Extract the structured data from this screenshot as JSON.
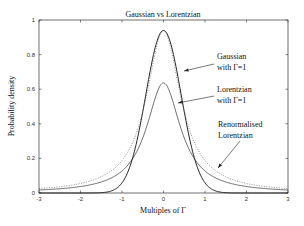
{
  "chart_data": {
    "type": "line",
    "title": "Gaussian vs Lorentzian",
    "xlabel": "Multiples of Γ",
    "ylabel": "Probability density",
    "xlim": [
      -3,
      3
    ],
    "ylim": [
      0,
      1
    ],
    "xticks": [
      "-3",
      "-2",
      "-1",
      "0",
      "1",
      "2",
      "3"
    ],
    "yticks": [
      "0",
      "0.2",
      "0.4",
      "0.6",
      "0.8",
      "1"
    ],
    "grid": false,
    "series": [
      {
        "name": "Gaussian with Γ=1",
        "style": "solid",
        "formula": "FWHM=1 gaussian",
        "peak": 0.94,
        "x": [
          -3,
          -2,
          -1.5,
          -1,
          -0.75,
          -0.5,
          -0.25,
          0,
          0.25,
          0.5,
          0.75,
          1,
          1.5,
          2,
          3
        ],
        "y": [
          0.0,
          0.0,
          0.0,
          0.06,
          0.21,
          0.47,
          0.79,
          0.94,
          0.79,
          0.47,
          0.21,
          0.06,
          0.0,
          0.0,
          0.0
        ]
      },
      {
        "name": "Lorentzian with Γ=1",
        "style": "solid",
        "formula": "FWHM=1 lorentzian",
        "peak": 0.64,
        "x": [
          -3,
          -2,
          -1.5,
          -1,
          -0.75,
          -0.5,
          -0.25,
          0,
          0.25,
          0.5,
          0.75,
          1,
          1.5,
          2,
          3
        ],
        "y": [
          0.02,
          0.04,
          0.07,
          0.13,
          0.2,
          0.32,
          0.51,
          0.64,
          0.51,
          0.32,
          0.2,
          0.13,
          0.07,
          0.04,
          0.02
        ]
      },
      {
        "name": "Renormalised Lorentzian",
        "style": "dotted",
        "formula": "peak-matched lorentzian",
        "peak": 0.94,
        "x": [
          -3,
          -2,
          -1.5,
          -1,
          -0.75,
          -0.5,
          -0.25,
          0,
          0.25,
          0.5,
          0.75,
          1,
          1.5,
          2,
          3
        ],
        "y": [
          0.03,
          0.06,
          0.09,
          0.19,
          0.29,
          0.47,
          0.75,
          0.94,
          0.75,
          0.47,
          0.29,
          0.19,
          0.09,
          0.06,
          0.03
        ]
      }
    ],
    "annotations": [
      {
        "line1": "Gaussian",
        "line2": "with Γ=1"
      },
      {
        "line1": "Lorentzian",
        "line2": "with Γ=1"
      },
      {
        "line1": "Renormalised",
        "line2": "Lorentzian"
      }
    ]
  }
}
